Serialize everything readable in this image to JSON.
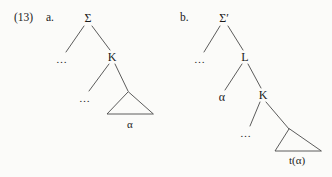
{
  "figure": {
    "example_number": "(13)",
    "background_color": "#fbfbf9",
    "line_color": "#4a4a4a",
    "text_color": "#1a1a1a"
  },
  "trees": [
    {
      "letter": "a.",
      "letter_x": 46,
      "letter_y": 18,
      "root": "Σ",
      "nodes": [
        {
          "id": "sigma",
          "label": "Σ",
          "x": 88,
          "y": 18,
          "kind": "node"
        },
        {
          "id": "dots1",
          "label": "…",
          "x": 62,
          "y": 59,
          "kind": "ellipsis"
        },
        {
          "id": "k",
          "label": "K",
          "x": 112,
          "y": 57,
          "kind": "node"
        },
        {
          "id": "dots2",
          "label": "…",
          "x": 85,
          "y": 98,
          "kind": "ellipsis"
        },
        {
          "id": "alpha",
          "label": "α",
          "x": 130,
          "y": 124,
          "kind": "terminal"
        }
      ],
      "edges": [
        {
          "from": "sigma",
          "to": "dots1",
          "x1": 84,
          "y1": 26,
          "x2": 66,
          "y2": 52
        },
        {
          "from": "sigma",
          "to": "k",
          "x1": 92,
          "y1": 26,
          "x2": 110,
          "y2": 50
        },
        {
          "from": "k",
          "to": "dots2",
          "x1": 109,
          "y1": 64,
          "x2": 89,
          "y2": 91
        },
        {
          "from": "k",
          "to": "triangle",
          "x1": 115,
          "y1": 64,
          "x2": 128,
          "y2": 91
        }
      ],
      "triangle": {
        "apex_x": 128,
        "apex_y": 92,
        "left_x": 107,
        "right_x": 153,
        "base_y": 114,
        "label": "α"
      }
    },
    {
      "letter": "b.",
      "letter_x": 180,
      "letter_y": 18,
      "root": "Σ′",
      "nodes": [
        {
          "id": "sigma-prime",
          "label": "Σ′",
          "x": 224,
          "y": 18,
          "kind": "node"
        },
        {
          "id": "dots1",
          "label": "…",
          "x": 200,
          "y": 59,
          "kind": "ellipsis"
        },
        {
          "id": "l",
          "label": "L",
          "x": 245,
          "y": 57,
          "kind": "node"
        },
        {
          "id": "alpha",
          "label": "α",
          "x": 222,
          "y": 97,
          "kind": "node"
        },
        {
          "id": "k",
          "label": "K",
          "x": 263,
          "y": 95,
          "kind": "node"
        },
        {
          "id": "dots2",
          "label": "…",
          "x": 246,
          "y": 133,
          "kind": "ellipsis"
        },
        {
          "id": "trace",
          "label": "t(α)",
          "x": 297,
          "y": 160,
          "kind": "terminal"
        }
      ],
      "edges": [
        {
          "from": "sigma-prime",
          "to": "dots1",
          "x1": 220,
          "y1": 26,
          "x2": 204,
          "y2": 52
        },
        {
          "from": "sigma-prime",
          "to": "l",
          "x1": 228,
          "y1": 26,
          "x2": 243,
          "y2": 50
        },
        {
          "from": "l",
          "to": "alpha",
          "x1": 242,
          "y1": 64,
          "x2": 225,
          "y2": 90
        },
        {
          "from": "l",
          "to": "k",
          "x1": 248,
          "y1": 64,
          "x2": 261,
          "y2": 88
        },
        {
          "from": "k",
          "to": "dots2",
          "x1": 260,
          "y1": 102,
          "x2": 250,
          "y2": 126
        },
        {
          "from": "k",
          "to": "triangle",
          "x1": 266,
          "y1": 102,
          "x2": 289,
          "y2": 129
        }
      ],
      "triangle": {
        "apex_x": 289,
        "apex_y": 129,
        "left_x": 275,
        "right_x": 321,
        "base_y": 151,
        "label": "t(α)"
      }
    }
  ]
}
